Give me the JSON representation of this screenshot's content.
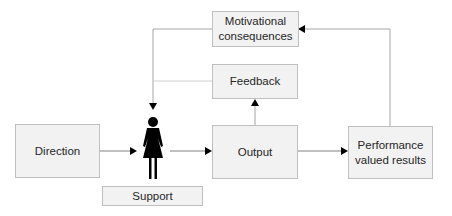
{
  "diagram": {
    "nodes": {
      "motivational": {
        "line1": "Motivational",
        "line2": "consequences"
      },
      "feedback": {
        "label": "Feedback"
      },
      "direction": {
        "label": "Direction"
      },
      "output": {
        "label": "Output"
      },
      "performance": {
        "line1": "Performance",
        "line2": "valued results"
      },
      "support": {
        "label": "Support"
      },
      "person": {
        "icon": "woman-icon"
      }
    },
    "edges": [
      {
        "from": "direction",
        "to": "person"
      },
      {
        "from": "person",
        "to": "output"
      },
      {
        "from": "output",
        "to": "performance"
      },
      {
        "from": "output",
        "to": "feedback"
      },
      {
        "from": "performance",
        "to": "motivational"
      },
      {
        "from": "motivational",
        "to": "person"
      },
      {
        "from": "feedback",
        "to": "person"
      }
    ],
    "colors": {
      "box_fill": "#f2f2f2",
      "box_border": "#bfbfbf",
      "line": "#a6a6a6",
      "arrow": "#000000",
      "person": "#000000"
    }
  }
}
